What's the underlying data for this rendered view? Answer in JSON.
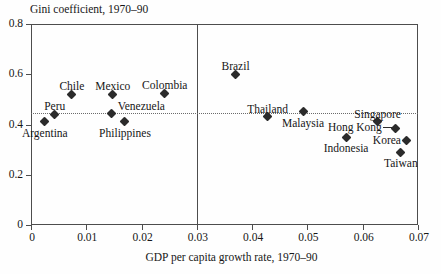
{
  "chart_data": {
    "type": "scatter",
    "title": "",
    "ylabel": "Gini coefficient, 1970–90",
    "xlabel": "GDP per capita growth rate, 1970–90",
    "xlim": [
      0,
      0.07
    ],
    "ylim": [
      0,
      0.8
    ],
    "xticks": [
      "0",
      "0.01",
      "0.02",
      "0.03",
      "0.04",
      "0.05",
      "0.06",
      "0.07"
    ],
    "xtick_values": [
      0,
      0.01,
      0.02,
      0.03,
      0.04,
      0.05,
      0.06,
      0.07
    ],
    "yticks": [
      "0",
      "0.2",
      "0.4",
      "0.6",
      "0.8"
    ],
    "ytick_values": [
      0,
      0.2,
      0.4,
      0.6,
      0.8
    ],
    "grid": false,
    "legend": null,
    "annotations": {
      "vertical_divider_x": 0.03,
      "horizontal_reference_y": 0.445
    },
    "marker": "diamond",
    "marker_color": "#2b2b2b",
    "points": [
      {
        "label": "Argentina",
        "x": 0.0025,
        "y": 0.41,
        "label_pos": "below"
      },
      {
        "label": "Peru",
        "x": 0.0043,
        "y": 0.44,
        "label_pos": "above"
      },
      {
        "label": "Chile",
        "x": 0.0074,
        "y": 0.52,
        "label_pos": "above"
      },
      {
        "label": "Mexico",
        "x": 0.0148,
        "y": 0.52,
        "label_pos": "above"
      },
      {
        "label": "Venezuela",
        "x": 0.0146,
        "y": 0.445,
        "label_pos": "right"
      },
      {
        "label": "Philippines",
        "x": 0.017,
        "y": 0.41,
        "label_pos": "below"
      },
      {
        "label": "Colombia",
        "x": 0.0242,
        "y": 0.525,
        "label_pos": "above"
      },
      {
        "label": "Brazil",
        "x": 0.037,
        "y": 0.6,
        "label_pos": "above"
      },
      {
        "label": "Thailand",
        "x": 0.0428,
        "y": 0.43,
        "label_pos": "above"
      },
      {
        "label": "Malaysia",
        "x": 0.0492,
        "y": 0.45,
        "label_pos": "below"
      },
      {
        "label": "Hong Kong",
        "x": 0.066,
        "y": 0.386,
        "label_pos": "left-leader"
      },
      {
        "label": "Indonesia",
        "x": 0.057,
        "y": 0.35,
        "label_pos": "below"
      },
      {
        "label": "Singapore",
        "x": 0.0627,
        "y": 0.41,
        "label_pos": "above"
      },
      {
        "label": "Korea",
        "x": 0.068,
        "y": 0.335,
        "label_pos": "left"
      },
      {
        "label": "Taiwan",
        "x": 0.0669,
        "y": 0.29,
        "label_pos": "below"
      }
    ]
  },
  "axis": {
    "y_title": "Gini coefficient, 1970–90",
    "x_title": "GDP per capita growth rate, 1970–90"
  },
  "ticks": {
    "y": [
      "0.8",
      "0.6",
      "0.4",
      "0.2",
      "0"
    ],
    "x": [
      "0",
      "0.01",
      "0.02",
      "0.03",
      "0.04",
      "0.05",
      "0.06",
      "0.07"
    ]
  },
  "labels": {
    "argentina": "Argentina",
    "peru": "Peru",
    "chile": "Chile",
    "mexico": "Mexico",
    "venezuela": "Venezuela",
    "philippines": "Philippines",
    "colombia": "Colombia",
    "brazil": "Brazil",
    "thailand": "Thailand",
    "malaysia": "Malaysia",
    "hong_kong": "Hong Kong",
    "indonesia": "Indonesia",
    "singapore": "Singapore",
    "korea": "Korea",
    "taiwan": "Taiwan"
  }
}
